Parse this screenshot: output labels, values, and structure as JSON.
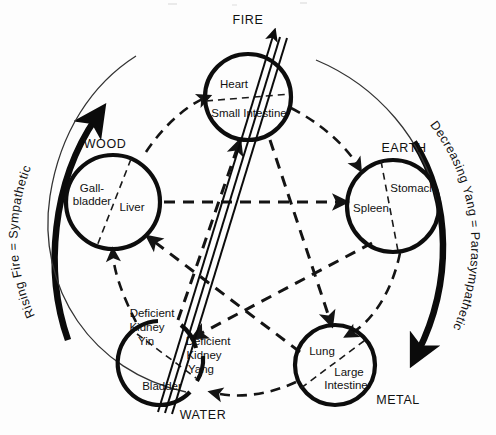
{
  "diagram": {
    "title_visible": false,
    "background_color": "#fdfdfd",
    "ink_color": "#111111",
    "phases": [
      {
        "id": "fire",
        "element_label": "FIRE",
        "element_label_pos": {
          "x": 248,
          "y": 20
        },
        "center": {
          "x": 248,
          "y": 97
        },
        "radius": 43,
        "yin_organ": "Heart",
        "yang_organ": "Small Intestine",
        "yin_pos": {
          "x": 235,
          "y": 85
        },
        "yang_pos": {
          "x": 248,
          "y": 112
        },
        "broken": false
      },
      {
        "id": "earth",
        "element_label": "EARTH",
        "element_label_pos": {
          "x": 404,
          "y": 148
        },
        "center": {
          "x": 393,
          "y": 206
        },
        "radius": 46,
        "yin_organ": "Spleen",
        "yang_organ": "Stomach",
        "yin_pos": {
          "x": 374,
          "y": 211
        },
        "yang_pos": {
          "x": 411,
          "y": 191
        },
        "broken": false
      },
      {
        "id": "metal",
        "element_label": "METAL",
        "element_label_pos": {
          "x": 398,
          "y": 400
        },
        "center": {
          "x": 335,
          "y": 365
        },
        "radius": 40,
        "yin_organ": "Lung",
        "yang_organ": "Large Intestine",
        "yin_pos": {
          "x": 322,
          "y": 354
        },
        "yang_pos": {
          "x": 347,
          "y": 375
        },
        "broken": false
      },
      {
        "id": "water",
        "element_label": "WATER",
        "element_label_pos": {
          "x": 203,
          "y": 415
        },
        "center": {
          "x": 163,
          "y": 362
        },
        "radius": 42,
        "yin_organ": "Deficient Kidney Yin",
        "yang_organ": "Deficient Kidney Yang",
        "extra_organ": "Bladder",
        "broken": true,
        "break_note": "circle is interrupted where the triple Rising-Fire line passes through"
      },
      {
        "id": "wood",
        "element_label": "WOOD",
        "element_label_pos": {
          "x": 105,
          "y": 144
        },
        "center": {
          "x": 113,
          "y": 202
        },
        "radius": 47,
        "yin_organ": "Liver",
        "yang_organ": "Gall-bladder",
        "yin_pos": {
          "x": 128,
          "y": 207
        },
        "yang_pos": {
          "x": 92,
          "y": 196
        },
        "broken": false
      }
    ],
    "water_labels": [
      {
        "text": "Deficient",
        "x": 152,
        "y": 313
      },
      {
        "text": "Kidney",
        "x": 147,
        "y": 327
      },
      {
        "text": "Yin",
        "x": 146,
        "y": 341
      },
      {
        "text": "Deficient",
        "x": 207,
        "y": 341
      },
      {
        "text": "Kidney",
        "x": 203,
        "y": 355
      },
      {
        "text": "Yang",
        "x": 200,
        "y": 369
      },
      {
        "text": "Bladder",
        "x": 162,
        "y": 386
      }
    ],
    "outer_arrows": [
      {
        "id": "rising-fire",
        "label": "Rising Fire = Sympathetic",
        "side": "left",
        "direction": "upward",
        "style": "thick-curved-arrow",
        "meaning": "Sympathetic activation ascending from Water to Fire"
      },
      {
        "id": "decreasing-yang",
        "label": "Decreasing Yang = Parasympathetic",
        "side": "right",
        "direction": "downward",
        "style": "thick-curved-arrow",
        "meaning": "Parasympathetic descent from Fire toward Metal"
      }
    ],
    "sheng_cycle": {
      "name": "generating cycle",
      "style": "dashed outer arcs, clockwise",
      "order": [
        "WOOD",
        "FIRE",
        "EARTH",
        "METAL",
        "WATER",
        "WOOD"
      ]
    },
    "ko_cycle": {
      "name": "controlling cycle",
      "style": "dashed inner pentagram",
      "edges": [
        "WOOD controls EARTH",
        "EARTH controls WATER",
        "WATER controls FIRE",
        "FIRE controls METAL",
        "METAL controls WOOD"
      ]
    },
    "rising_fire_line": {
      "style": "triple parallel solid line with arrowhead",
      "from": "WATER (deficient kidney)",
      "to": "above FIRE",
      "direction": "up and to the right"
    }
  }
}
